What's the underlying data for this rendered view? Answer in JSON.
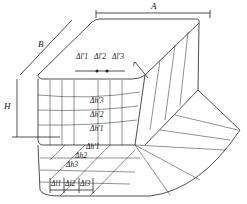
{
  "diagram": {
    "dimensions": {
      "A": "A",
      "B": "B",
      "H": "H"
    },
    "top_labels": [
      "Δl′1",
      "Δl′2",
      "Δl′3"
    ],
    "radius_label": "r",
    "wall_labels": [
      "Δh′3",
      "Δh′2",
      "Δh′1"
    ],
    "flange_labels": [
      "Δh′1",
      "Δh2",
      "Δh3"
    ],
    "bottom_labels": [
      "Δl1",
      "Δl2",
      "Δl3"
    ],
    "colors": {
      "line": "#222222",
      "background": "#ffffff"
    }
  }
}
